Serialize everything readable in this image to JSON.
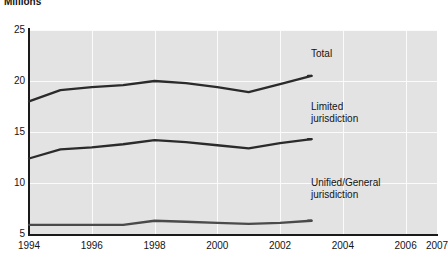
{
  "chart_data": {
    "type": "line",
    "title": "Millions",
    "xlabel": "",
    "ylabel": "",
    "xlim": [
      1994,
      2007
    ],
    "ylim": [
      5,
      25
    ],
    "grid": true,
    "legend_position": "inline-right",
    "y_ticks": [
      25,
      20,
      15,
      10,
      5
    ],
    "x_ticks": [
      1994,
      1996,
      1998,
      2000,
      2002,
      2004,
      2006,
      2007
    ],
    "x": [
      1994,
      1995,
      1996,
      1997,
      1998,
      1999,
      2000,
      2001,
      2002,
      2003
    ],
    "series": [
      {
        "name": "Total",
        "label": "Total",
        "color": "#2b2b2b",
        "values": [
          18.0,
          19.1,
          19.4,
          19.6,
          20.0,
          19.8,
          19.4,
          18.9,
          19.7,
          20.5
        ]
      },
      {
        "name": "Limited jurisdiction",
        "label": "Limited\njurisdiction",
        "color": "#2b2b2b",
        "values": [
          12.4,
          13.3,
          13.5,
          13.8,
          14.2,
          14.0,
          13.7,
          13.4,
          13.9,
          14.3
        ]
      },
      {
        "name": "Unified/General jurisdiction",
        "label": "Unified/General\njurisdiction",
        "color": "#4a4a4a",
        "values": [
          5.9,
          5.9,
          5.9,
          5.9,
          6.3,
          6.2,
          6.1,
          6.0,
          6.1,
          6.3
        ]
      }
    ]
  },
  "axis": {
    "y_labels": [
      "25",
      "20",
      "15",
      "10",
      "5"
    ],
    "x_labels": [
      "1994",
      "1996",
      "1998",
      "2000",
      "2002",
      "2004",
      "2006",
      "2007"
    ]
  },
  "labels": {
    "total": "Total",
    "limited_line1": "Limited",
    "limited_line2": "jurisdiction",
    "unified_line1": "Unified/General",
    "unified_line2": "jurisdiction"
  },
  "colors": {
    "plot_background": "#e3e3e3",
    "gridline": "#fbfbfb",
    "axis": "#1a1a1a",
    "line_dark": "#2b2b2b",
    "line_gray": "#4a4a4a",
    "text": "#141414",
    "page_background": "#ffffff"
  }
}
